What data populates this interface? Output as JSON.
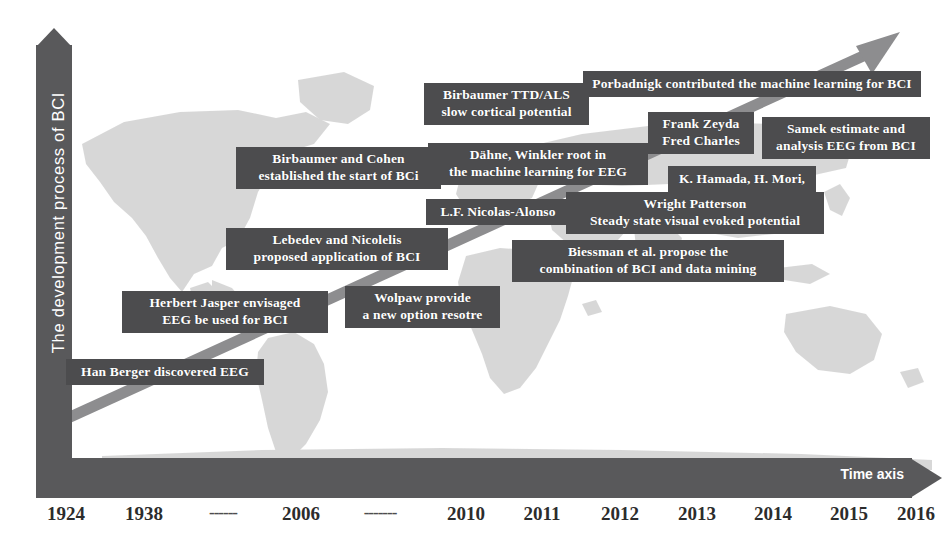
{
  "figure": {
    "y_axis_label": "The development process of BCI",
    "x_axis_label": "Time axis",
    "box_color": "#4c4c4e",
    "axis_color": "#59595b",
    "trend_color": "#8d8d8f",
    "text_color": "#ffffff"
  },
  "chart_data": {
    "type": "timeline",
    "title": "The development process of BCI",
    "xlabel": "Time axis",
    "ylabel": "The development process of BCI",
    "tick_labels": [
      "1924",
      "1938",
      "------",
      "2006",
      "-------",
      "2010",
      "2011",
      "2012",
      "2013",
      "2014",
      "2015",
      "2016"
    ],
    "events": [
      {
        "id": "han-berger",
        "year": "1924",
        "text": "Han Berger discovered  EEG"
      },
      {
        "id": "herbert-jasper",
        "year": "1938",
        "text": "Herbert Jasper  envisaged\nEEG be used for BCI"
      },
      {
        "id": "lebedev-nicolelis",
        "year": "2006",
        "text": "Lebedev and Nicolelis\nproposed  application of BCI"
      },
      {
        "id": "wolpaw",
        "year": "2006",
        "text": "Wolpaw provide\na new option resotre"
      },
      {
        "id": "birbaumer-cohen",
        "year": "2006",
        "text": "Birbaumer and Cohen\nestablished the start of  BCi"
      },
      {
        "id": "birbaumer-ttd-als",
        "year": "2010",
        "text": "Birbaumer TTD/ALS\nslow cortical potential"
      },
      {
        "id": "dahne-winkler",
        "year": "2011",
        "text": "Dähne, Winkler  root in\nthe machine learning for EEG"
      },
      {
        "id": "nicolas-alonso",
        "year": "2011",
        "text": "L.F. Nicolas-Alonso"
      },
      {
        "id": "biessman",
        "year": "2012",
        "text": "Biessman et al. propose the\ncombination of BCI and  data mining"
      },
      {
        "id": "wright-patterson",
        "year": "2013",
        "text": "Wright Patterson\nSteady state visual evoked potential"
      },
      {
        "id": "hamada-mori",
        "year": "2013",
        "text": "K. Hamada, H. Mori,"
      },
      {
        "id": "frank-zeyda",
        "year": "2014",
        "text": "Frank Zeyda\nFred Charles"
      },
      {
        "id": "samek",
        "year": "2015",
        "text": "Samek estimate and\nanalysis EEG from BCI"
      },
      {
        "id": "porbadnigk",
        "year": "2016",
        "text": "Porbadnigk contributed the machine learning for BCI"
      }
    ]
  },
  "ticks": [
    {
      "label": "1924",
      "x": 66
    },
    {
      "label": "1938",
      "x": 144
    },
    {
      "label": "------",
      "x": 223
    },
    {
      "label": "2006",
      "x": 301
    },
    {
      "label": "-------",
      "x": 380
    },
    {
      "label": "2010",
      "x": 466
    },
    {
      "label": "2011",
      "x": 542
    },
    {
      "label": "2012",
      "x": 620
    },
    {
      "label": "2013",
      "x": 697
    },
    {
      "label": "2014",
      "x": 773
    },
    {
      "label": "2015",
      "x": 849
    },
    {
      "label": "2016",
      "x": 916
    }
  ],
  "events": [
    {
      "id": "han-berger",
      "name": "event-han-berger",
      "text": "Han Berger discovered  EEG",
      "x": 66,
      "y": 359,
      "w": 198
    },
    {
      "id": "herbert-jasper",
      "name": "event-herbert-jasper",
      "text": "Herbert Jasper  envisaged\nEEG be used for BCI",
      "x": 122,
      "y": 291,
      "w": 206
    },
    {
      "id": "wolpaw",
      "name": "event-wolpaw",
      "text": "Wolpaw provide\na new option resotre",
      "x": 345,
      "y": 286,
      "w": 155
    },
    {
      "id": "lebedev-nicolelis",
      "name": "event-lebedev-nicolelis",
      "text": "Lebedev and Nicolelis\nproposed  application of BCI",
      "x": 226,
      "y": 228,
      "w": 222
    },
    {
      "id": "birbaumer-cohen",
      "name": "event-birbaumer-cohen",
      "text": "Birbaumer and Cohen\nestablished the start of  BCi",
      "x": 236,
      "y": 147,
      "w": 205
    },
    {
      "id": "nicolas-alonso",
      "name": "event-nicolas-alonso",
      "text": "L.F. Nicolas-Alonso",
      "x": 426,
      "y": 199,
      "w": 144
    },
    {
      "id": "dahne-winkler",
      "name": "event-dahne-winkler",
      "text": "Dähne, Winkler  root in\nthe machine learning for EEG",
      "x": 428,
      "y": 143,
      "w": 220
    },
    {
      "id": "birbaumer-ttd-als",
      "name": "event-birbaumer-ttd-als",
      "text": "Birbaumer TTD/ALS\nslow cortical potential",
      "x": 424,
      "y": 83,
      "w": 165
    },
    {
      "id": "porbadnigk",
      "name": "event-porbadnigk",
      "text": "Porbadnigk contributed the machine learning for BCI",
      "x": 583,
      "y": 71,
      "w": 338
    },
    {
      "id": "frank-zeyda",
      "name": "event-frank-zeyda",
      "text": "Frank Zeyda\nFred Charles",
      "x": 648,
      "y": 112,
      "w": 106
    },
    {
      "id": "samek",
      "name": "event-samek",
      "text": "Samek estimate and\nanalysis EEG from BCI",
      "x": 762,
      "y": 117,
      "w": 168
    },
    {
      "id": "hamada-mori",
      "name": "event-hamada-mori",
      "text": "K. Hamada, H. Mori,",
      "x": 668,
      "y": 166,
      "w": 148
    },
    {
      "id": "wright-patterson",
      "name": "event-wright-patterson",
      "text": "Wright Patterson\nSteady state visual evoked potential",
      "x": 566,
      "y": 192,
      "w": 258
    },
    {
      "id": "biessman",
      "name": "event-biessman",
      "text": "Biessman et al. propose the\ncombination of BCI and  data mining",
      "x": 512,
      "y": 240,
      "w": 272
    }
  ]
}
